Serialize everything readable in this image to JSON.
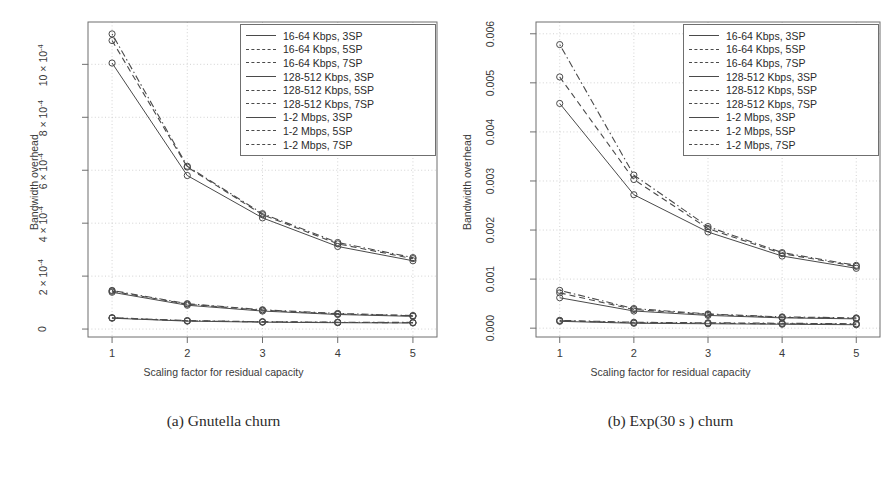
{
  "figure": {
    "background": "#ffffff",
    "line_color": "#4a4a4a",
    "grid_color": "#c8c8c8",
    "axis_color": "#6f6f6f"
  },
  "panels": [
    {
      "id": "a",
      "caption": "(a) Gnutella churn",
      "chart_data": {
        "type": "line",
        "title": "",
        "xlabel": "Scaling factor for residual capacity",
        "ylabel": "Bandwidth overhead",
        "x": [
          1,
          2,
          3,
          4,
          5
        ],
        "xlim": [
          0.68,
          5.32
        ],
        "ylim": [
          -3e-05,
          0.00116
        ],
        "xticks": [
          "1",
          "2",
          "3",
          "4",
          "5"
        ],
        "yticks": [
          "0",
          "2 × 10",
          "4 × 10",
          "6 × 10",
          "8 × 10",
          "10 × 10"
        ],
        "ytick_exponent": "-4",
        "ytick_values": [
          0,
          0.0002,
          0.0004,
          0.0006,
          0.0008,
          0.001
        ],
        "grid": true,
        "legend_position": "top-right",
        "series": [
          {
            "name": "16-64 Kbps, 3SP",
            "style": "solid",
            "values": [
              0.001005,
              0.00058,
              0.00042,
              0.000312,
              0.000258
            ]
          },
          {
            "name": "16-64 Kbps, 5SP",
            "style": "dashed",
            "values": [
              0.00109,
              0.000612,
              0.000432,
              0.000322,
              0.000266
            ]
          },
          {
            "name": "16-64 Kbps, 7SP",
            "style": "dotdash",
            "values": [
              0.001115,
              0.000615,
              0.000436,
              0.000327,
              0.00027
            ]
          },
          {
            "name": "128-512 Kbps, 3SP",
            "style": "solid",
            "values": [
              0.000139,
              9e-05,
              6.8e-05,
              5.5e-05,
              4.8e-05
            ]
          },
          {
            "name": "128-512 Kbps, 5SP",
            "style": "dashed",
            "values": [
              0.000143,
              9.4e-05,
              7.1e-05,
              5.7e-05,
              5e-05
            ]
          },
          {
            "name": "128-512 Kbps, 7SP",
            "style": "dotdash",
            "values": [
              0.000146,
              9.6e-05,
              7.3e-05,
              5.9e-05,
              5.1e-05
            ]
          },
          {
            "name": "1-2 Mbps, 3SP",
            "style": "solid",
            "values": [
              4.1e-05,
              3e-05,
              2.6e-05,
              2.4e-05,
              2.3e-05
            ]
          },
          {
            "name": "1-2 Mbps, 5SP",
            "style": "dashed",
            "values": [
              4.2e-05,
              3.1e-05,
              2.7e-05,
              2.5e-05,
              2.4e-05
            ]
          },
          {
            "name": "1-2 Mbps, 7SP",
            "style": "dotdash",
            "values": [
              4.3e-05,
              3.2e-05,
              2.8e-05,
              2.6e-05,
              2.5e-05
            ]
          }
        ]
      }
    },
    {
      "id": "b",
      "caption": "(b) Exp(30 s ) churn",
      "chart_data": {
        "type": "line",
        "title": "",
        "xlabel": "Scaling factor for residual capacity",
        "ylabel": "Bandwidth overhead",
        "x": [
          1,
          2,
          3,
          4,
          5
        ],
        "xlim": [
          0.68,
          5.32
        ],
        "ylim": [
          -0.00018,
          0.00624
        ],
        "xticks": [
          "1",
          "2",
          "3",
          "4",
          "5"
        ],
        "yticks": [
          "0.000",
          "0.001",
          "0.002",
          "0.003",
          "0.004",
          "0.005",
          "0.006"
        ],
        "ytick_values": [
          0,
          0.001,
          0.002,
          0.003,
          0.004,
          0.005,
          0.006
        ],
        "grid": true,
        "legend_position": "top-right",
        "series": [
          {
            "name": "16-64 Kbps, 3SP",
            "style": "solid",
            "values": [
              0.00458,
              0.00272,
              0.00196,
              0.00147,
              0.00122
            ]
          },
          {
            "name": "16-64 Kbps, 5SP",
            "style": "dashed",
            "values": [
              0.00512,
              0.00303,
              0.00203,
              0.00152,
              0.00126
            ]
          },
          {
            "name": "16-64 Kbps, 7SP",
            "style": "dotdash",
            "values": [
              0.00578,
              0.00312,
              0.00207,
              0.00154,
              0.00128
            ]
          },
          {
            "name": "128-512 Kbps, 3SP",
            "style": "solid",
            "values": [
              0.00062,
              0.00035,
              0.00026,
              0.00021,
              0.00019
            ]
          },
          {
            "name": "128-512 Kbps, 5SP",
            "style": "dashed",
            "values": [
              0.00072,
              0.00038,
              0.00028,
              0.00022,
              0.0002
            ]
          },
          {
            "name": "128-512 Kbps, 7SP",
            "style": "dotdash",
            "values": [
              0.00077,
              0.0004,
              0.00029,
              0.00023,
              0.00021
            ]
          },
          {
            "name": "1-2 Mbps, 3SP",
            "style": "solid",
            "values": [
              0.00014,
              0.0001,
              9e-05,
              8e-05,
              7e-05
            ]
          },
          {
            "name": "1-2 Mbps, 5SP",
            "style": "dashed",
            "values": [
              0.00015,
              0.00011,
              0.0001,
              9e-05,
              8e-05
            ]
          },
          {
            "name": "1-2 Mbps, 7SP",
            "style": "dotdash",
            "values": [
              0.00016,
              0.00012,
              0.00011,
              0.0001,
              9e-05
            ]
          }
        ]
      }
    }
  ]
}
